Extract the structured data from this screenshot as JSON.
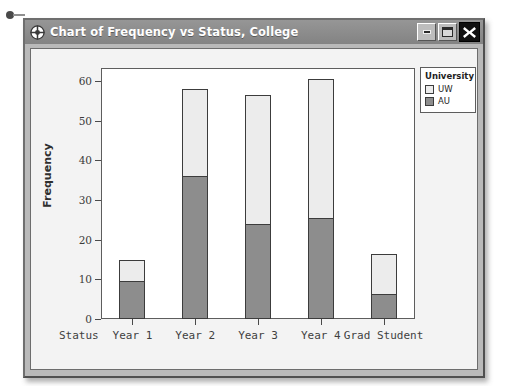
{
  "window": {
    "title": "Chart of Frequency vs Status, College",
    "icon": "crosshair-target-icon",
    "controls": {
      "minimize": "–",
      "maximize": "□",
      "close": "✕"
    }
  },
  "colors": {
    "titlebar": "#8d8d8d",
    "frame": "#b9b9b9",
    "client": "#f3f3f3",
    "plot_bg": "#ffffff",
    "uw": "#ececec",
    "au": "#8d8d8d",
    "outline": "#3c3c3c",
    "close_button": "#101010"
  },
  "chart_data": {
    "type": "bar",
    "subtype": "stacked",
    "title": "Chart of Frequency vs Status, College",
    "xlabel": "Status",
    "ylabel": "Frequency",
    "categories": [
      "Year 1",
      "Year 2",
      "Year 3",
      "Year 4",
      "Grad Student"
    ],
    "series": [
      {
        "name": "AU",
        "color": "#8d8d8d",
        "values": [
          9.5,
          36,
          24,
          25.5,
          6.3
        ]
      },
      {
        "name": "UW",
        "color": "#ececec",
        "values": [
          5.5,
          22,
          32.5,
          35,
          10.2
        ]
      }
    ],
    "totals": [
      15,
      58,
      56.5,
      60.5,
      16.5
    ],
    "ylim": [
      0,
      60
    ],
    "yticks": [
      0,
      10,
      20,
      30,
      40,
      50,
      60
    ],
    "ytick_labels": [
      "0",
      "10",
      "20",
      "30",
      "40",
      "50",
      "60"
    ],
    "grid": false,
    "legend": {
      "title": "University",
      "position": "top-right-outside",
      "entries": [
        "UW",
        "AU"
      ]
    }
  }
}
